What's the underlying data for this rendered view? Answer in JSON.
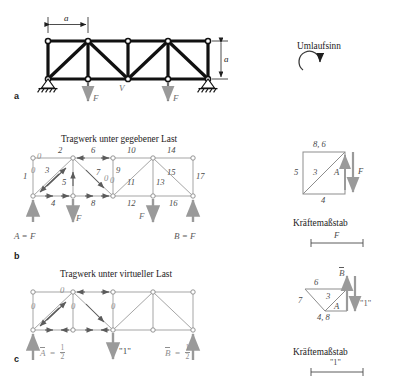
{
  "figure": {
    "panels": [
      {
        "key": "a",
        "letter": "a",
        "title": ""
      },
      {
        "key": "b",
        "letter": "b",
        "title": "Tragwerk unter gegebener Last"
      },
      {
        "key": "c",
        "letter": "c",
        "title": "Tragwerk unter virtueller Last"
      }
    ]
  },
  "panel_a": {
    "dim_span": "a",
    "dim_height": "a",
    "shear_label": "V",
    "load_left": "F",
    "load_right": "F",
    "orientation_title": "Umlaufsinn",
    "orientation_icon": "ccw-arc-arrow-icon"
  },
  "panel_b": {
    "title": "Tragwerk unter gegebener Last",
    "letter": "b",
    "member_numbers": [
      "1",
      "2",
      "3",
      "4",
      "5",
      "6",
      "7",
      "8",
      "9",
      "10",
      "11",
      "12",
      "13",
      "14",
      "15",
      "16",
      "17"
    ],
    "zero_markers": [
      "0",
      "0",
      "0",
      "0",
      "0"
    ],
    "reaction_left": "A = F",
    "reaction_right": "B = F",
    "load_left": "F",
    "load_right": "F",
    "polygon": {
      "top_label": "8, 6",
      "left_label": "5",
      "diag_label": "3",
      "inner_label": "A",
      "bottom_label": "4",
      "force_label": "F",
      "scale_title": "Kräftemaßstab",
      "scale_value": "F"
    }
  },
  "panel_c": {
    "title": "Tragwerk unter virtueller Last",
    "letter": "c",
    "zero_markers": [
      "0",
      "0",
      "0",
      "0"
    ],
    "reaction_left_sym": "A",
    "reaction_left_num": "1",
    "reaction_left_den": "2",
    "reaction_right_sym": "B",
    "reaction_right_num": "1",
    "reaction_right_den": "2",
    "virtual_load": "\"1\"",
    "polygon": {
      "top_label": "6",
      "left_label": "7",
      "diag_label": "3",
      "inner_label": "A",
      "bottom_label": "4, 8",
      "reaction_label": "B",
      "force_label": "\"1\"",
      "scale_title": "Kräftemaßstab",
      "scale_value": "\"1\""
    }
  }
}
